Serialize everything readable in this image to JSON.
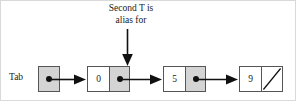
{
  "diagram": {
    "annotation": {
      "line1": "Second T is",
      "line2": "alias for"
    },
    "pointer_label": "Tab",
    "nodes": [
      {
        "id": "node-tab",
        "data": "",
        "pointer": "dot",
        "kind": "pointer-only"
      },
      {
        "id": "node-zero",
        "data": "0",
        "pointer": "dot",
        "kind": "data-pointer"
      },
      {
        "id": "node-five",
        "data": "5",
        "pointer": "dot",
        "kind": "data-pointer"
      },
      {
        "id": "node-nine",
        "data": "9",
        "pointer": "null",
        "kind": "data-null"
      }
    ],
    "arrows": [
      {
        "id": "arrow-tab-to-zero",
        "from": "node-tab",
        "to": "node-zero",
        "direction": "right"
      },
      {
        "id": "arrow-zero-to-five",
        "from": "node-zero",
        "to": "node-five",
        "direction": "right"
      },
      {
        "id": "arrow-five-to-nine",
        "from": "node-five",
        "to": "node-nine",
        "direction": "right"
      },
      {
        "id": "arrow-annotation",
        "from": "annotation",
        "to": "node-zero",
        "direction": "down"
      }
    ],
    "colors": {
      "pointer_cell_fill": "#d4d4d4",
      "data_cell_fill": "#ffffff",
      "border": "#555555",
      "ink": "#111111",
      "background": "#ffffff"
    }
  }
}
